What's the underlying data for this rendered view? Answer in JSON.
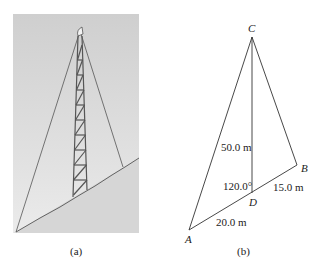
{
  "figure_a": {
    "caption": "(a)",
    "description": "Photo-style illustration of a guyed lattice tower on a slope"
  },
  "figure_b": {
    "caption": "(b)",
    "points": {
      "A": "A",
      "B": "B",
      "C": "C",
      "D": "D"
    },
    "labels": {
      "cd_length": "50.0 m",
      "angle": "120.0°",
      "db_length": "15.0 m",
      "ad_length": "20.0 m"
    }
  }
}
